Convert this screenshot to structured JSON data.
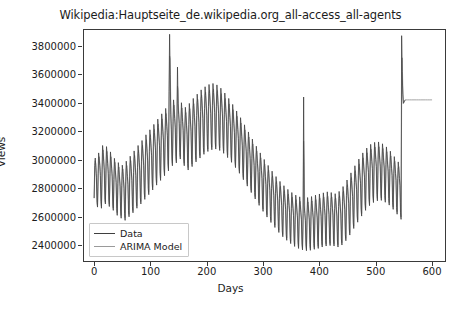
{
  "chart_data": {
    "type": "line",
    "title": "Wikipedia:Hauptseite_de.wikipedia.org_all-access_all-agents",
    "xlabel": "Days",
    "ylabel": "Views",
    "xlim": [
      -18,
      623
    ],
    "ylim": [
      2290000,
      3910000
    ],
    "xticks": [
      0,
      100,
      200,
      300,
      400,
      500,
      600
    ],
    "xtick_labels": [
      "0",
      "100",
      "200",
      "300",
      "400",
      "500",
      "600"
    ],
    "yticks": [
      2400000,
      2600000,
      2800000,
      3000000,
      3200000,
      3400000,
      3600000,
      3800000
    ],
    "ytick_labels": [
      "2400000",
      "2600000",
      "2800000",
      "3000000",
      "3200000",
      "3400000",
      "3600000",
      "3800000"
    ],
    "grid": false,
    "legend_position": "lower left",
    "series": [
      {
        "name": "Data",
        "color": "#3f3f3f",
        "linewidth": 0.8,
        "x_start": 0,
        "x_step": 1,
        "values": [
          2731000,
          2960000,
          3012000,
          2946000,
          2878000,
          2700000,
          2668000,
          2905000,
          3048000,
          3005000,
          2962000,
          2890000,
          2706000,
          2660000,
          2930000,
          3100000,
          3050000,
          2985000,
          2922000,
          2724000,
          2690000,
          2955000,
          3092000,
          3038000,
          2972000,
          2905000,
          2718000,
          2672000,
          2905000,
          3055000,
          3000000,
          2941000,
          2880000,
          2690000,
          2645000,
          2862000,
          3010000,
          2965000,
          2900000,
          2840000,
          2660000,
          2610000,
          2835000,
          2980000,
          2930000,
          2872000,
          2815000,
          2640000,
          2590000,
          2818000,
          2962000,
          2918000,
          2860000,
          2800000,
          2625000,
          2575000,
          2845000,
          2990000,
          2940000,
          2882000,
          2825000,
          2645000,
          2600000,
          2880000,
          3025000,
          2975000,
          2915000,
          2855000,
          2672000,
          2628000,
          2912000,
          3062000,
          3010000,
          2948000,
          2890000,
          2705000,
          2660000,
          2948000,
          3100000,
          3045000,
          2982000,
          2922000,
          2735000,
          2690000,
          2985000,
          3135000,
          3082000,
          3018000,
          2958000,
          2768000,
          2722000,
          3020000,
          3175000,
          3118000,
          3052000,
          2992000,
          2800000,
          2755000,
          3058000,
          3210000,
          3155000,
          3088000,
          3028000,
          2835000,
          2788000,
          3095000,
          3248000,
          3192000,
          3125000,
          3062000,
          2868000,
          2822000,
          3130000,
          3285000,
          3228000,
          3160000,
          3098000,
          2902000,
          2855000,
          3168000,
          3322000,
          3265000,
          3196000,
          3132000,
          2935000,
          2888000,
          3205000,
          3360000,
          3302000,
          3232000,
          3168000,
          2970000,
          2922000,
          3480000,
          3880000,
          3600000,
          3320000,
          3210000,
          3005000,
          2958000,
          3270000,
          3420000,
          3360000,
          3290000,
          3225000,
          3025000,
          2978000,
          3300000,
          3650000,
          3395000,
          3320000,
          3255000,
          3052000,
          3005000,
          3255000,
          3400000,
          3340000,
          3268000,
          3205000,
          3005000,
          2958000,
          3222000,
          3368000,
          3308000,
          3238000,
          3175000,
          2975000,
          2928000,
          3248000,
          3395000,
          3335000,
          3265000,
          3200000,
          3000000,
          2952000,
          3282000,
          3430000,
          3370000,
          3298000,
          3235000,
          3032000,
          2985000,
          3310000,
          3460000,
          3400000,
          3328000,
          3262000,
          3060000,
          3012000,
          3338000,
          3490000,
          3428000,
          3355000,
          3290000,
          3085000,
          3038000,
          3360000,
          3512000,
          3450000,
          3378000,
          3312000,
          3105000,
          3058000,
          3375000,
          3528000,
          3465000,
          3392000,
          3325000,
          3118000,
          3070000,
          3382000,
          3535000,
          3472000,
          3398000,
          3332000,
          3122000,
          3075000,
          3372000,
          3525000,
          3462000,
          3388000,
          3322000,
          3112000,
          3065000,
          3350000,
          3502000,
          3440000,
          3366000,
          3300000,
          3092000,
          3045000,
          3318000,
          3468000,
          3406000,
          3332000,
          3268000,
          3062000,
          3015000,
          3282000,
          3430000,
          3368000,
          3296000,
          3232000,
          3028000,
          2982000,
          3242000,
          3388000,
          3328000,
          3256000,
          3192000,
          2990000,
          2945000,
          3198000,
          3342000,
          3282000,
          3212000,
          3148000,
          2950000,
          2905000,
          3152000,
          3295000,
          3235000,
          3165000,
          3102000,
          2905000,
          2860000,
          3105000,
          3245000,
          3188000,
          3118000,
          3055000,
          2860000,
          2815000,
          3058000,
          3195000,
          3138000,
          3070000,
          3008000,
          2815000,
          2770000,
          3010000,
          3145000,
          3088000,
          3020000,
          2960000,
          2770000,
          2725000,
          2962000,
          3095000,
          3038000,
          2972000,
          2912000,
          2725000,
          2680000,
          2918000,
          3048000,
          2992000,
          2926000,
          2868000,
          2682000,
          2638000,
          2875000,
          3002000,
          2948000,
          2882000,
          2825000,
          2642000,
          2598000,
          2835000,
          2960000,
          2905000,
          2840000,
          2785000,
          2602000,
          2560000,
          2798000,
          2920000,
          2866000,
          2802000,
          2748000,
          2568000,
          2525000,
          2762000,
          2882000,
          2828000,
          2765000,
          2712000,
          2532000,
          2490000,
          2730000,
          2848000,
          2795000,
          2732000,
          2680000,
          2502000,
          2460000,
          2702000,
          2818000,
          2765000,
          2702000,
          2652000,
          2475000,
          2435000,
          2678000,
          2792000,
          2740000,
          2678000,
          2628000,
          2452000,
          2412000,
          2658000,
          2770000,
          2718000,
          2658000,
          2608000,
          2432000,
          2392000,
          2642000,
          2752000,
          2700000,
          2640000,
          2592000,
          2418000,
          2378000,
          2632000,
          2740000,
          2688000,
          2628000,
          2580000,
          2408000,
          2368000,
          2625000,
          3440000,
          2682000,
          2622000,
          2575000,
          2402000,
          2362000,
          2628000,
          2735000,
          2685000,
          2625000,
          2578000,
          2405000,
          2365000,
          2635000,
          2742000,
          2692000,
          2632000,
          2585000,
          2412000,
          2372000,
          2645000,
          2752000,
          2700000,
          2640000,
          2592000,
          2420000,
          2378000,
          2655000,
          2760000,
          2710000,
          2650000,
          2602000,
          2428000,
          2388000,
          2662000,
          2768000,
          2718000,
          2658000,
          2610000,
          2435000,
          2395000,
          2668000,
          2775000,
          2722000,
          2662000,
          2615000,
          2440000,
          2398000,
          2665000,
          2770000,
          2720000,
          2660000,
          2612000,
          2438000,
          2395000,
          2658000,
          2762000,
          2712000,
          2652000,
          2605000,
          2430000,
          2388000,
          2672000,
          2778000,
          2728000,
          2668000,
          2620000,
          2445000,
          2402000,
          2705000,
          2812000,
          2760000,
          2700000,
          2652000,
          2475000,
          2432000,
          2748000,
          2858000,
          2805000,
          2742000,
          2695000,
          2515000,
          2472000,
          2795000,
          2908000,
          2855000,
          2792000,
          2742000,
          2560000,
          2518000,
          2842000,
          2958000,
          2902000,
          2840000,
          2790000,
          2605000,
          2562000,
          2888000,
          3005000,
          2950000,
          2885000,
          2835000,
          2650000,
          2605000,
          2928000,
          3048000,
          2992000,
          2928000,
          2878000,
          2690000,
          2645000,
          2962000,
          3082000,
          3028000,
          2962000,
          2912000,
          2722000,
          2678000,
          2985000,
          3108000,
          3052000,
          2988000,
          2938000,
          2745000,
          2700000,
          2998000,
          3122000,
          3068000,
          3002000,
          2952000,
          2758000,
          2712000,
          3000000,
          3125000,
          3070000,
          3005000,
          2955000,
          2760000,
          2715000,
          2988000,
          3112000,
          3058000,
          2992000,
          2942000,
          2748000,
          2702000,
          2968000,
          3090000,
          3035000,
          2970000,
          2920000,
          2728000,
          2682000,
          2940000,
          3060000,
          3005000,
          2940000,
          2890000,
          2698000,
          2652000,
          2905000,
          3022000,
          2968000,
          2905000,
          2855000,
          2665000,
          2618000,
          2868000,
          2985000,
          2930000,
          2868000,
          2818000,
          2628000,
          2582000,
          3870000,
          3620000,
          3460000,
          3395000,
          3405000,
          3412000,
          3418000
        ]
      },
      {
        "name": "ARIMA Model",
        "color": "#9a9a9a",
        "linewidth": 0.8,
        "fit_note": "overlays Data across the observed range then continues as a flat forecast",
        "forecast_start_day": 546,
        "forecast_end_day": 600,
        "forecast_value": 3420000
      }
    ],
    "annotations": [
      {
        "day": 140,
        "value": 3880000,
        "note": "global maximum spike"
      },
      {
        "day": 378,
        "value": 3440000,
        "note": "isolated narrow spike"
      },
      {
        "day": 420,
        "value": 2362000,
        "note": "lowest trough"
      },
      {
        "day": 546,
        "value": 3870000,
        "note": "terminal spike before forecast"
      }
    ]
  },
  "legend": {
    "items": [
      {
        "label": "Data",
        "color": "#3f3f3f"
      },
      {
        "label": "ARIMA Model",
        "color": "#9a9a9a"
      }
    ]
  }
}
